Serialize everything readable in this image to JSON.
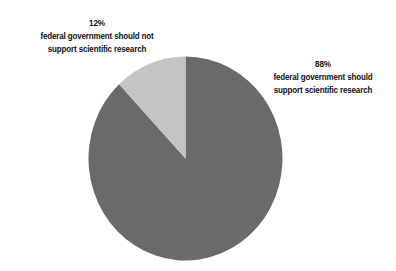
{
  "chart_data": {
    "type": "pie",
    "title": "",
    "subtitle": "",
    "xlabel": "",
    "ylabel": "",
    "grid": false,
    "legend_position": "callout-labels",
    "start_angle_deg": 90,
    "direction": "clockwise",
    "categories": [
      "federal government should support scientific research",
      "federal government should not support scientific research"
    ],
    "values": [
      88,
      12
    ],
    "units": "percent",
    "colors": [
      "#6a6a6a",
      "#c4c4c4"
    ],
    "slices": [
      {
        "name": "support",
        "percent_label": "88%",
        "value": 88,
        "color": "#6a6a6a",
        "label_lines": [
          "federal government should",
          "support scientific research"
        ],
        "label_position": "right"
      },
      {
        "name": "not-support",
        "percent_label": "12%",
        "value": 12,
        "color": "#c4c4c4",
        "label_lines": [
          "federal government should not",
          "support scientific research"
        ],
        "label_position": "top-left"
      }
    ]
  },
  "colors": {
    "background": "#ffffff",
    "slice_support": "#6a6a6a",
    "slice_not_support": "#c4c4c4",
    "text": "#111111"
  },
  "labels": {
    "left": {
      "percent": "12%",
      "line1": "federal government should not",
      "line2": "support scientific research"
    },
    "right": {
      "percent": "88%",
      "line1": "federal government should",
      "line2": "support scientific research"
    }
  }
}
